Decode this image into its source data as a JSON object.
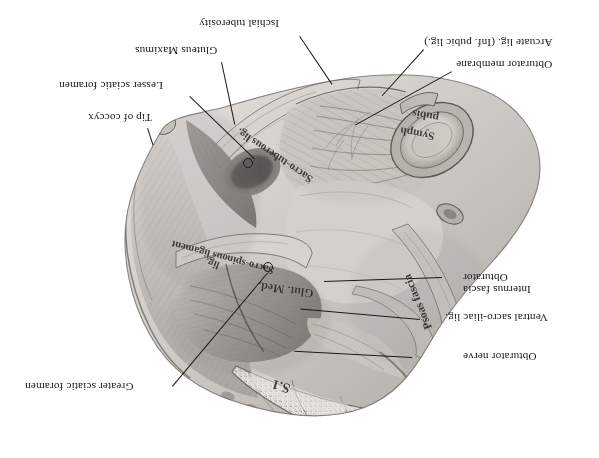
{
  "plate": {
    "title": "Pelvic ligaments and fascia — inverted anatomical plate",
    "orientation": "180-degree rotated (upside-down)",
    "rendering": "grayscale halftone engraving on white background",
    "background_color": "#ffffff",
    "ink_color": "#1a1a1a"
  },
  "labels": [
    {
      "id": "ischial-tuberosity",
      "text": "Ischial tuberosity"
    },
    {
      "id": "gluteus-maximus",
      "text": "Gluteus Maximus"
    },
    {
      "id": "lesser-sciatic-foramen",
      "text": "Lesser sciatic foramen"
    },
    {
      "id": "tip-of-coccyx",
      "text": "Tip of coccyx"
    },
    {
      "id": "arcuate-lig",
      "text": "Arcuate lig. (Inf. pubic lig.)"
    },
    {
      "id": "obturator-membrane",
      "text": "Obturator membrane"
    },
    {
      "id": "obturator-internus-fascia-line1",
      "text": "Obturator"
    },
    {
      "id": "obturator-internus-fascia-line2",
      "text": "Internus fascia"
    },
    {
      "id": "ventral-sacro-iliac-lig",
      "text": "Ventral sacro-iliac lig."
    },
    {
      "id": "obturator-nerve",
      "text": "Obturator nerve"
    },
    {
      "id": "greater-sciatic-foramen",
      "text": "Greater sciatic foramen"
    }
  ],
  "figure_text": [
    {
      "id": "sacro-tuberous-lig",
      "text": "Sacro-tuberous lig."
    },
    {
      "id": "sacro-spinous-ligament",
      "text": "Sacro-spinous ligament"
    },
    {
      "id": "glut-med",
      "text": "Glut. Med."
    },
    {
      "id": "lig",
      "text": "lig."
    },
    {
      "id": "psoas-fascia",
      "text": "Psoas fascia"
    },
    {
      "id": "symph-pubis-line1",
      "text": "Symph"
    },
    {
      "id": "symph-pubis-line2",
      "text": "pubis"
    },
    {
      "id": "sacral-vertebra",
      "text": "S.1"
    }
  ]
}
